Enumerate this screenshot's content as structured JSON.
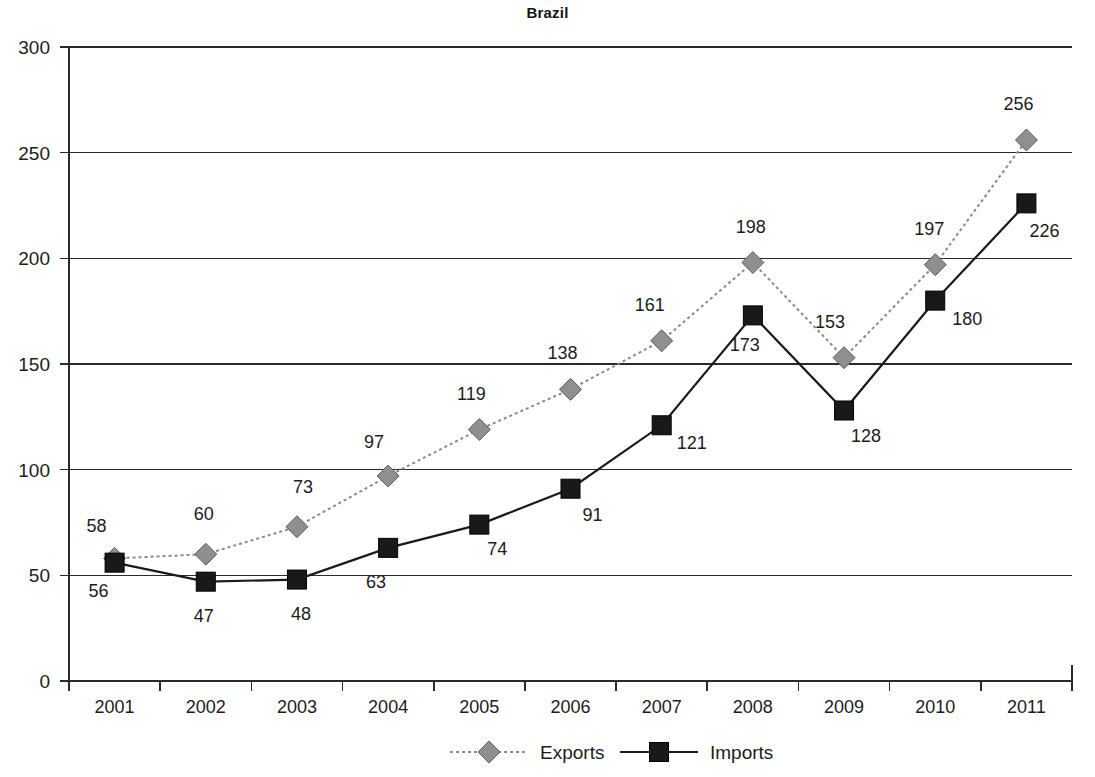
{
  "chart_data": {
    "type": "line",
    "title": "Brazil",
    "xlabel": "",
    "ylabel": "",
    "categories": [
      "2001",
      "2002",
      "2003",
      "2004",
      "2005",
      "2006",
      "2007",
      "2008",
      "2009",
      "2010",
      "2011"
    ],
    "series": [
      {
        "name": "Exports",
        "marker": "diamond",
        "line_style": "dotted",
        "color": "#8f8f8f",
        "values": [
          58,
          60,
          73,
          97,
          119,
          138,
          161,
          198,
          153,
          197,
          256
        ]
      },
      {
        "name": "Imports",
        "marker": "square",
        "line_style": "solid",
        "color": "#191919",
        "values": [
          56,
          47,
          48,
          63,
          74,
          91,
          121,
          173,
          128,
          180,
          226
        ]
      }
    ],
    "ylim": [
      0,
      300
    ],
    "yticks": [
      0,
      50,
      100,
      150,
      200,
      250,
      300
    ],
    "ytick_labels": [
      "0",
      "50",
      "100",
      "150",
      "200",
      "250",
      "300"
    ],
    "grid": true,
    "grid_axis": "y",
    "legend_position": "bottom-center",
    "data_labels": true,
    "label_offsets": {
      "exports": [
        {
          "dx": -18,
          "dy": -26
        },
        {
          "dx": -2,
          "dy": -34
        },
        {
          "dx": 6,
          "dy": -34
        },
        {
          "dx": -14,
          "dy": -28
        },
        {
          "dx": -8,
          "dy": -30
        },
        {
          "dx": -8,
          "dy": -30
        },
        {
          "dx": -12,
          "dy": -30
        },
        {
          "dx": -2,
          "dy": -30
        },
        {
          "dx": -14,
          "dy": -30
        },
        {
          "dx": -6,
          "dy": -30
        },
        {
          "dx": -8,
          "dy": -30
        }
      ],
      "imports": [
        {
          "dx": -16,
          "dy": 34
        },
        {
          "dx": -2,
          "dy": 40
        },
        {
          "dx": 4,
          "dy": 40
        },
        {
          "dx": -12,
          "dy": 40
        },
        {
          "dx": 18,
          "dy": 30
        },
        {
          "dx": 22,
          "dy": 32
        },
        {
          "dx": 30,
          "dy": 24
        },
        {
          "dx": -8,
          "dy": 36
        },
        {
          "dx": 22,
          "dy": 32
        },
        {
          "dx": 32,
          "dy": 24
        },
        {
          "dx": 18,
          "dy": 34
        }
      ]
    }
  },
  "legend": {
    "items": [
      {
        "label": "Exports",
        "key": "exports"
      },
      {
        "label": "Imports",
        "key": "imports"
      }
    ]
  },
  "colors": {
    "exports": "#8f8f8f",
    "imports": "#191919",
    "axis": "#2b2b2b",
    "text": "#1c1c1c",
    "background": "#ffffff"
  }
}
